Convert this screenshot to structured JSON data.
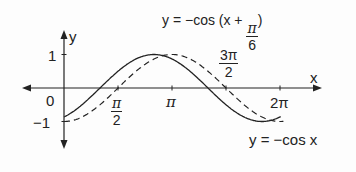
{
  "chart_data": {
    "type": "line",
    "title": "",
    "xlabel": "x",
    "ylabel": "y",
    "x_ticks": [
      {
        "label": "0",
        "value": 0
      },
      {
        "label": "π/2",
        "value": 1.5708
      },
      {
        "label": "π",
        "value": 3.1416
      },
      {
        "label": "3π/2",
        "value": 4.7124
      },
      {
        "label": "2π",
        "value": 6.2832
      }
    ],
    "y_ticks": [
      {
        "label": "1",
        "value": 1
      },
      {
        "label": "−1",
        "value": -1
      }
    ],
    "xlim": [
      -0.75,
      6.6
    ],
    "ylim": [
      -1.2,
      1.2
    ],
    "grid": false,
    "series": [
      {
        "name": "y = −cos (x + π/6)",
        "style": "solid",
        "x": [
          0,
          1.0472,
          2.618,
          4.1888,
          5.7596,
          6.2832
        ],
        "values": [
          -0.866,
          0,
          1,
          0,
          -1,
          -0.866
        ]
      },
      {
        "name": "y = −cos x",
        "style": "dashed",
        "x": [
          0,
          1.5708,
          3.1416,
          4.7124,
          6.2832
        ],
        "values": [
          -1,
          0,
          1,
          0,
          -1
        ]
      }
    ],
    "annotations": [
      {
        "text": "y = −cos (x + π/6)",
        "position": "top-right"
      },
      {
        "text": "y = −cos x",
        "position": "bottom-right"
      }
    ]
  },
  "labels": {
    "y_axis": "y",
    "x_axis": "x",
    "origin": "0",
    "y_one": "1",
    "y_neg_one": "−1",
    "pi": "π",
    "pi_half_num": "π",
    "pi_half_den": "2",
    "three_pi_half_num": "3π",
    "three_pi_half_den": "2",
    "two_pi": "2π",
    "top_eq_prefix": "y = −cos (x + ",
    "top_eq_frac_num": "π",
    "top_eq_frac_den": "6",
    "top_eq_suffix": ")",
    "bottom_eq": "y = −cos x"
  }
}
